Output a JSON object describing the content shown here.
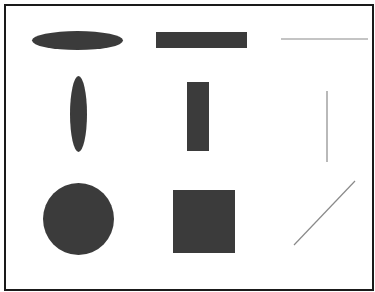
{
  "diagram": {
    "layout": "3x3 grid of primitive shapes inside a bordered frame",
    "colors": {
      "fill": "#3b3b3b",
      "line": "#8a8a8a",
      "border": "#1a1a1a",
      "background": "#ffffff"
    },
    "rows": [
      {
        "orientation": "horizontal",
        "shapes": [
          {
            "kind": "ellipse",
            "x": 32,
            "y": 31,
            "w": 91,
            "h": 19
          },
          {
            "kind": "rectangle",
            "x": 156,
            "y": 32,
            "w": 91,
            "h": 16
          },
          {
            "kind": "line",
            "x1": 281,
            "y1": 39,
            "x2": 368,
            "y2": 39
          }
        ]
      },
      {
        "orientation": "vertical",
        "shapes": [
          {
            "kind": "ellipse",
            "x": 70,
            "y": 76,
            "w": 17,
            "h": 76
          },
          {
            "kind": "rectangle",
            "x": 187,
            "y": 82,
            "w": 22,
            "h": 69
          },
          {
            "kind": "line",
            "x1": 327,
            "y1": 91,
            "x2": 327,
            "y2": 162
          }
        ]
      },
      {
        "orientation": "symmetric-diagonal",
        "shapes": [
          {
            "kind": "circle",
            "x": 43,
            "y": 183,
            "w": 71,
            "h": 72
          },
          {
            "kind": "square",
            "x": 173,
            "y": 190,
            "w": 62,
            "h": 63
          },
          {
            "kind": "line",
            "x1": 294,
            "y1": 245,
            "x2": 355,
            "y2": 181
          }
        ]
      }
    ]
  }
}
